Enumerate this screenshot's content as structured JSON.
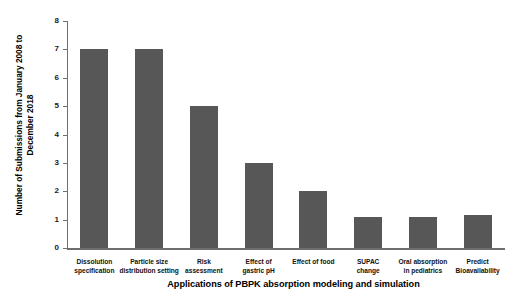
{
  "chart_data": {
    "type": "bar",
    "title": "",
    "xlabel": "Applications of PBPK absorption modeling and simulation",
    "ylabel": "Number of Submissions from January 2008 to December 2018",
    "ylabel_line1": "Number of Submissions from January 2008 to",
    "ylabel_line2": "December 2018",
    "categories": [
      "Dissolution specification",
      "Particle size distribution setting",
      "Risk assessment",
      "Effect of gastric pH",
      "Effect of food",
      "SUPAC change",
      "Oral absorption in pediatrics",
      "Predict Bioavailability"
    ],
    "category_lines": [
      [
        "Dissolution",
        "specification"
      ],
      [
        "Particle size",
        "distribution setting"
      ],
      [
        "Risk",
        "assessment"
      ],
      [
        "Effect of",
        "gastric pH"
      ],
      [
        "Effect of food"
      ],
      [
        "SUPAC",
        "change"
      ],
      [
        "Oral absorption",
        "in pediatrics"
      ],
      [
        "Predict",
        "Bioavailability"
      ]
    ],
    "values": [
      7,
      7,
      5,
      3,
      2,
      1.1,
      1.1,
      1.15
    ],
    "ylim": [
      0,
      8
    ],
    "yticks": [
      0,
      1,
      2,
      3,
      4,
      5,
      6,
      7,
      8
    ],
    "ytick_labels": [
      "0",
      "1",
      "2",
      "3",
      "4",
      "5",
      "6",
      "7",
      "8"
    ],
    "grid": false,
    "legend": "none",
    "bar_color": "#575757",
    "axis_color": "#6f6f6f",
    "background_color": "#ffffff"
  }
}
